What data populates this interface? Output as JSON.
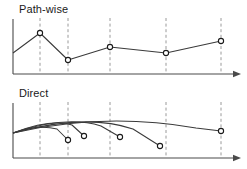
{
  "figure": {
    "width": 247,
    "height": 169,
    "background": "#ffffff",
    "line_color": "#3a3a3a",
    "axis_color": "#4a4a4a",
    "gridline_color": "#9a9a9a",
    "marker_fill": "#ffffff",
    "marker_stroke": "#1a1a1a",
    "text_color": "#1a1a1a"
  },
  "panels": [
    {
      "id": "pathwise",
      "title": "Path-wise",
      "axis": {
        "x_start": 13,
        "x_end": 241,
        "y_baseline": 74,
        "y_top": 19,
        "arrow": "right"
      },
      "gridlines": [
        40,
        68,
        110,
        166,
        221
      ],
      "chart_data": {
        "type": "line",
        "title": "Path-wise",
        "xlabel": "",
        "ylabel": "",
        "grid": true,
        "legend": false,
        "markers": "open-circle",
        "x": [
          13,
          40,
          68,
          110,
          166,
          221
        ],
        "y": [
          53,
          33,
          60,
          47,
          53,
          41
        ],
        "marker_at_first_point": false,
        "xlim": [
          13,
          241
        ],
        "ylim": [
          74,
          19
        ]
      }
    },
    {
      "id": "direct",
      "title": "Direct",
      "axis": {
        "x_start": 13,
        "x_end": 241,
        "y_baseline": 158,
        "y_top": 103,
        "arrow": "right"
      },
      "gridlines": [
        40,
        68,
        110,
        166,
        221
      ],
      "chart_data": {
        "type": "line",
        "title": "Direct",
        "xlabel": "",
        "ylabel": "",
        "grid": true,
        "legend": false,
        "markers": "open-circle",
        "origin": [
          13,
          133
        ],
        "series": [
          {
            "name": "arc-1",
            "control": [
              38,
              124
            ],
            "arc_end": [
              57,
              129
            ],
            "endpoint": [
              68,
              140
            ],
            "marker": true
          },
          {
            "name": "arc-2",
            "control": [
              52,
              118
            ],
            "arc_end": [
              72,
              125
            ],
            "endpoint": [
              84,
              136
            ],
            "marker": true
          },
          {
            "name": "arc-3",
            "control": [
              66,
              115
            ],
            "arc_end": [
              101,
              126
            ],
            "endpoint": [
              120,
              137
            ],
            "marker": true
          },
          {
            "name": "arc-4",
            "control": [
              86,
              113
            ],
            "arc_end": [
              133,
              129
            ],
            "endpoint": [
              160,
              146
            ],
            "marker": true
          },
          {
            "name": "arc-5",
            "control": [
              104,
              112
            ],
            "arc_end": [
              196,
              128
            ],
            "endpoint": [
              221,
              131
            ],
            "marker": true
          }
        ],
        "xlim": [
          13,
          241
        ],
        "ylim": [
          158,
          103
        ]
      }
    }
  ]
}
